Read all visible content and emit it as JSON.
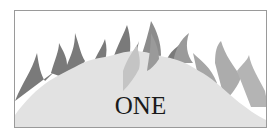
{
  "illustration": {
    "title": "ONE",
    "colors": {
      "frame_border": "#9a9a9a",
      "mound": "#e2e2e2",
      "flame_dark": "#7a7a7a",
      "flame_mid": "#9a9a9a",
      "flame_light": "#b4b4b4",
      "text": "#1a1a1a"
    }
  }
}
